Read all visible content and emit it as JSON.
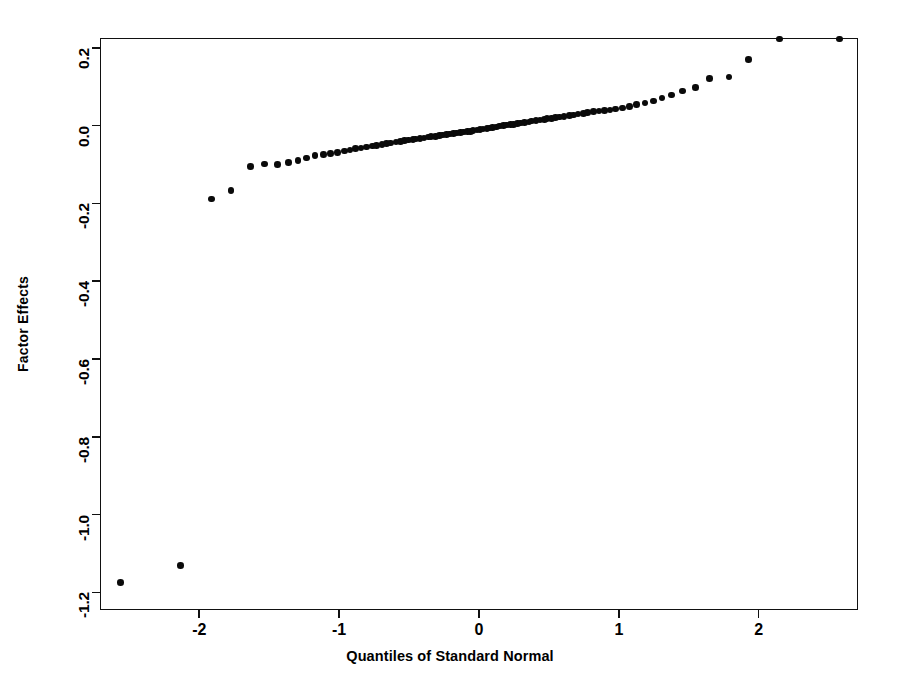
{
  "chart_data": {
    "type": "scatter",
    "title": "",
    "subtitle": "",
    "xlabel": "Quantiles of Standard Normal",
    "ylabel": "Factor Effects",
    "grid": false,
    "legend": false,
    "xlim": [
      -2.71,
      2.71
    ],
    "ylim": [
      -1.245,
      0.225
    ],
    "xticks": [
      -2,
      -1,
      0,
      1,
      2
    ],
    "xtick_labels": [
      "-2",
      "-1",
      "0",
      "1",
      "2"
    ],
    "yticks": [
      0.2,
      0.0,
      -0.2,
      -0.4,
      -0.6,
      -0.8,
      -1.0,
      -1.2
    ],
    "ytick_labels": [
      "0.2",
      "0.0",
      "-0.2",
      "-0.4",
      "-0.6",
      "-0.8",
      "-1.0",
      "-1.2"
    ],
    "marker": "filled-circle",
    "marker_color": "#0a0a0a",
    "marker_size_px": 6.6,
    "n_points": 111,
    "x": [
      -2.57,
      -2.14,
      -1.92,
      -1.78,
      -1.64,
      -1.54,
      -1.45,
      -1.37,
      -1.3,
      -1.24,
      -1.18,
      -1.12,
      -1.07,
      -1.02,
      -0.97,
      -0.93,
      -0.89,
      -0.85,
      -0.81,
      -0.77,
      -0.74,
      -0.7,
      -0.67,
      -0.64,
      -0.6,
      -0.57,
      -0.54,
      -0.51,
      -0.48,
      -0.46,
      -0.43,
      -0.4,
      -0.37,
      -0.35,
      -0.32,
      -0.29,
      -0.27,
      -0.24,
      -0.22,
      -0.19,
      -0.17,
      -0.14,
      -0.12,
      -0.09,
      -0.07,
      -0.05,
      -0.02,
      0.0,
      0.02,
      0.05,
      0.07,
      0.09,
      0.12,
      0.14,
      0.17,
      0.19,
      0.22,
      0.24,
      0.27,
      0.29,
      0.32,
      0.35,
      0.37,
      0.4,
      0.43,
      0.46,
      0.48,
      0.51,
      0.54,
      0.57,
      0.6,
      0.64,
      0.67,
      0.7,
      0.74,
      0.77,
      0.81,
      0.85,
      0.89,
      0.93,
      0.97,
      1.02,
      1.07,
      1.12,
      1.18,
      1.24,
      1.3,
      1.37,
      1.45,
      1.54,
      1.64,
      1.78,
      1.92,
      2.14,
      2.57
    ],
    "y": [
      -1.172,
      -1.128,
      -0.186,
      -0.165,
      -0.103,
      -0.096,
      -0.098,
      -0.092,
      -0.087,
      -0.081,
      -0.075,
      -0.072,
      -0.069,
      -0.066,
      -0.063,
      -0.06,
      -0.057,
      -0.055,
      -0.053,
      -0.05,
      -0.048,
      -0.046,
      -0.044,
      -0.042,
      -0.04,
      -0.038,
      -0.036,
      -0.035,
      -0.033,
      -0.032,
      -0.03,
      -0.029,
      -0.027,
      -0.026,
      -0.025,
      -0.023,
      -0.022,
      -0.021,
      -0.019,
      -0.018,
      -0.017,
      -0.016,
      -0.014,
      -0.013,
      -0.012,
      -0.01,
      -0.009,
      -0.008,
      -0.006,
      -0.005,
      -0.004,
      -0.002,
      -0.001,
      0.001,
      0.002,
      0.004,
      0.005,
      0.006,
      0.008,
      0.009,
      0.011,
      0.012,
      0.014,
      0.015,
      0.017,
      0.018,
      0.02,
      0.021,
      0.023,
      0.025,
      0.026,
      0.028,
      0.03,
      0.032,
      0.034,
      0.036,
      0.038,
      0.04,
      0.041,
      0.043,
      0.045,
      0.048,
      0.052,
      0.056,
      0.06,
      0.066,
      0.073,
      0.081,
      0.091,
      0.101,
      0.124,
      0.127,
      0.172
    ],
    "annotations": []
  },
  "axes": {
    "x": {
      "label": "Quantiles of Standard Normal",
      "ticks": [
        {
          "value": -2,
          "label": "-2"
        },
        {
          "value": -1,
          "label": "-1"
        },
        {
          "value": 0,
          "label": "0"
        },
        {
          "value": 1,
          "label": "1"
        },
        {
          "value": 2,
          "label": "2"
        }
      ]
    },
    "y": {
      "label": "Factor Effects",
      "ticks": [
        {
          "value": 0.2,
          "label": "0.2"
        },
        {
          "value": 0.0,
          "label": "0.0"
        },
        {
          "value": -0.2,
          "label": "-0.2"
        },
        {
          "value": -0.4,
          "label": "-0.4"
        },
        {
          "value": -0.6,
          "label": "-0.6"
        },
        {
          "value": -0.8,
          "label": "-0.8"
        },
        {
          "value": -1.0,
          "label": "-1.0"
        },
        {
          "value": -1.2,
          "label": "-1.2"
        }
      ]
    }
  },
  "colors": {
    "background": "#ffffff",
    "frame": "#111111",
    "marker": "#0a0a0a",
    "text": "#000000"
  }
}
